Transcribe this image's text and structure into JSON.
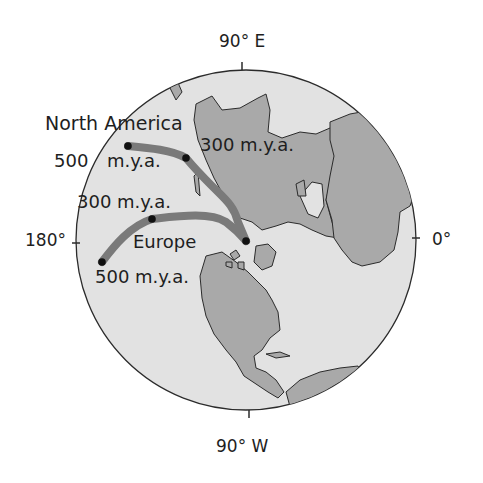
{
  "map": {
    "title": "",
    "projection": "polar azimuthal (North Pole centered)",
    "axis_labels": {
      "top": "90° E",
      "bottom": "90° W",
      "left": "180°",
      "right": "0°"
    },
    "colors": {
      "ocean": "#e2e2e2",
      "land": "#a9a9a9",
      "coastline": "#2b2b2b",
      "path": "#7a7a7a",
      "point": "#111111",
      "background": "#ffffff"
    },
    "paths": [
      {
        "name": "North America",
        "label": "North America",
        "points": [
          {
            "label": "500",
            "suffix": "m.y.a.",
            "age_mya": 500
          },
          {
            "label": "300 m.y.a.",
            "age_mya": 300
          },
          {
            "label": "",
            "age_mya": 0
          }
        ]
      },
      {
        "name": "Europe",
        "label": "Europe",
        "points": [
          {
            "label": "500 m.y.a.",
            "age_mya": 500
          },
          {
            "label": "300 m.y.a.",
            "age_mya": 300
          },
          {
            "label": "",
            "age_mya": 0
          }
        ]
      }
    ]
  }
}
